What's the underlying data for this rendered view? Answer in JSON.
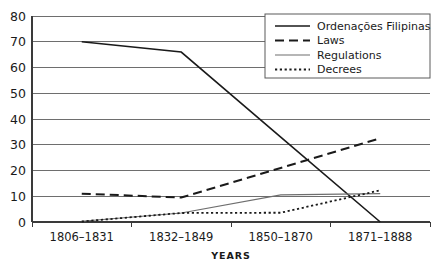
{
  "chart_data": {
    "type": "line",
    "title": "",
    "subtitle": "",
    "xlabel": "YEARS",
    "ylabel": "",
    "categories": [
      "1806–1831",
      "1832–1849",
      "1850–1870",
      "1871–1888"
    ],
    "ylim": [
      0,
      80
    ],
    "ytick_values": [
      0,
      10,
      20,
      30,
      40,
      50,
      60,
      70,
      80
    ],
    "ytick_labels": [
      "0",
      "10",
      "20",
      "30",
      "40",
      "50",
      "60",
      "70",
      "80"
    ],
    "grid": true,
    "grid_axis": "y",
    "legend_position": "top-right",
    "series": [
      {
        "name": "Ordenações Filipinas",
        "values": [
          70,
          66,
          33,
          0
        ],
        "style": "solid",
        "color": "#1a1a1a",
        "width": 1.6
      },
      {
        "name": "Laws",
        "values": [
          11,
          9.5,
          21,
          32.5
        ],
        "style": "dashed",
        "color": "#1a1a1a",
        "width": 2.0
      },
      {
        "name": "Regulations",
        "values": [
          0.3,
          3.5,
          10.5,
          11
        ],
        "style": "solid",
        "color": "#6e6e6e",
        "width": 1.2
      },
      {
        "name": "Decrees",
        "values": [
          0.2,
          3.5,
          3.6,
          12.3
        ],
        "style": "dotted",
        "color": "#1a1a1a",
        "width": 1.8
      }
    ]
  },
  "legend": {
    "entries": [
      {
        "label": "Ordenações Filipinas",
        "style": "solid",
        "color": "#1a1a1a"
      },
      {
        "label": "Laws",
        "style": "dashed",
        "color": "#1a1a1a"
      },
      {
        "label": "Regulations",
        "style": "solid",
        "color": "#6e6e6e"
      },
      {
        "label": "Decrees",
        "style": "dotted",
        "color": "#1a1a1a"
      }
    ]
  },
  "colors": {
    "background": "#ffffff",
    "grid": "#6e6e6e",
    "axis": "#3a3a3a",
    "text": "#1a1a1a"
  }
}
